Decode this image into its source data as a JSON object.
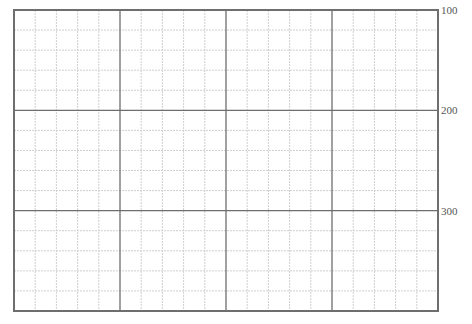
{
  "chart_data": {
    "type": "line",
    "title": "",
    "xlabel": "",
    "ylabel": "",
    "series": [],
    "grid": true,
    "legend": null,
    "y_axis_position": "right",
    "ylim": [
      100,
      400
    ],
    "y_ticks": [
      100,
      200,
      300
    ],
    "y_tick_labels": [
      "100",
      "200",
      "300"
    ],
    "x_major_divisions": 4,
    "y_major_divisions": 3,
    "minor_per_major": 5
  },
  "style": {
    "major_line_color": "#6e6e6e",
    "minor_line_color": "#cfcfcf",
    "frame_color": "#6e6e6e"
  },
  "plot_area": {
    "left": 14,
    "top": 10,
    "right": 438,
    "bottom": 311
  }
}
